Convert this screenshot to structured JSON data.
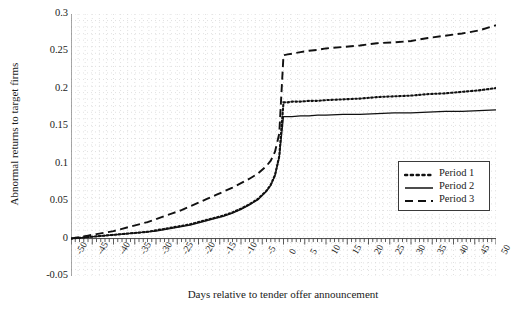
{
  "chart_data": {
    "type": "line",
    "title": "",
    "xlabel": "Days relative to tender offer announcement",
    "ylabel": "Abnormal returns to target firms",
    "xlim": [
      -50,
      50
    ],
    "ylim": [
      -0.05,
      0.3
    ],
    "xticks": [
      -50,
      -45,
      -40,
      -35,
      -30,
      -25,
      -20,
      -15,
      -10,
      -5,
      0,
      5,
      10,
      15,
      20,
      25,
      30,
      35,
      40,
      45,
      50
    ],
    "xtick_labels": [
      "-50",
      "-45",
      "-40",
      "-35",
      "-30",
      "-25",
      "-20",
      "-15",
      "-10",
      "-5",
      "0",
      "5",
      "10",
      "15",
      "20",
      "25",
      "30",
      "35",
      "40",
      "45",
      "50"
    ],
    "yticks": [
      -0.05,
      0,
      0.05,
      0.1,
      0.15,
      0.2,
      0.25,
      0.3
    ],
    "ytick_labels": [
      "-0.05",
      "0",
      "0.05",
      "0.1",
      "0.15",
      "0.2",
      "0.25",
      "0.3"
    ],
    "grid": true,
    "grid_style": "dotted",
    "grid_color": "#d9d9d9",
    "legend_position": "center-right",
    "x": [
      -50,
      -48,
      -46,
      -44,
      -42,
      -40,
      -38,
      -36,
      -34,
      -32,
      -30,
      -28,
      -26,
      -24,
      -22,
      -20,
      -18,
      -16,
      -14,
      -12,
      -10,
      -8,
      -6,
      -4,
      -3,
      -2,
      -1,
      0,
      1,
      2,
      4,
      6,
      8,
      10,
      14,
      18,
      22,
      26,
      30,
      34,
      38,
      42,
      46,
      50
    ],
    "series": [
      {
        "name": "Period 1",
        "style": "dotted",
        "color": "#111111",
        "values": [
          0.0,
          0.001,
          0.002,
          0.003,
          0.004,
          0.005,
          0.006,
          0.007,
          0.008,
          0.009,
          0.011,
          0.013,
          0.015,
          0.017,
          0.019,
          0.022,
          0.025,
          0.028,
          0.031,
          0.035,
          0.04,
          0.046,
          0.053,
          0.064,
          0.072,
          0.085,
          0.11,
          0.182,
          0.182,
          0.183,
          0.183,
          0.184,
          0.184,
          0.185,
          0.186,
          0.187,
          0.189,
          0.19,
          0.191,
          0.193,
          0.194,
          0.196,
          0.198,
          0.201
        ]
      },
      {
        "name": "Period 2",
        "style": "solid",
        "color": "#111111",
        "values": [
          0.0,
          0.001,
          0.002,
          0.003,
          0.004,
          0.005,
          0.006,
          0.007,
          0.008,
          0.009,
          0.01,
          0.012,
          0.014,
          0.016,
          0.018,
          0.021,
          0.024,
          0.027,
          0.03,
          0.034,
          0.039,
          0.045,
          0.052,
          0.063,
          0.071,
          0.084,
          0.108,
          0.163,
          0.163,
          0.163,
          0.164,
          0.164,
          0.165,
          0.165,
          0.166,
          0.166,
          0.167,
          0.168,
          0.168,
          0.169,
          0.17,
          0.17,
          0.171,
          0.172
        ]
      },
      {
        "name": "Period 3",
        "style": "dashed",
        "color": "#111111",
        "values": [
          0.0,
          0.002,
          0.004,
          0.006,
          0.008,
          0.01,
          0.013,
          0.016,
          0.019,
          0.022,
          0.026,
          0.03,
          0.034,
          0.038,
          0.043,
          0.048,
          0.053,
          0.058,
          0.063,
          0.068,
          0.074,
          0.08,
          0.087,
          0.097,
          0.104,
          0.116,
          0.14,
          0.245,
          0.246,
          0.247,
          0.249,
          0.251,
          0.252,
          0.254,
          0.256,
          0.258,
          0.261,
          0.262,
          0.264,
          0.268,
          0.271,
          0.274,
          0.278,
          0.285
        ]
      }
    ]
  },
  "legend": {
    "items": [
      {
        "label": "Period 1"
      },
      {
        "label": "Period 2"
      },
      {
        "label": "Period 3"
      }
    ]
  }
}
